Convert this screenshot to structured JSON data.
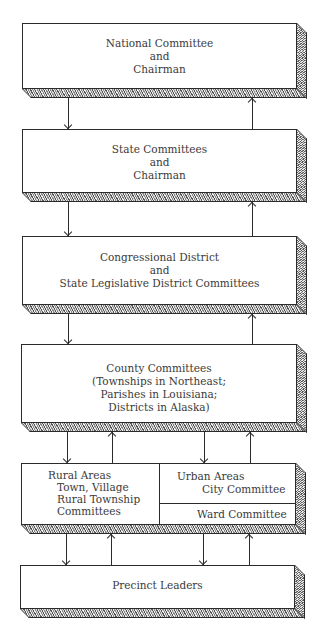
{
  "diagram": {
    "type": "hierarchy",
    "levels": [
      {
        "id": "national",
        "lines": [
          "National Committee",
          "and",
          "Chairman"
        ]
      },
      {
        "id": "state",
        "lines": [
          "State Committees",
          "and",
          "Chairman"
        ]
      },
      {
        "id": "congressional",
        "lines": [
          "Congressional District",
          "and",
          "State Legislative District Committees"
        ]
      },
      {
        "id": "county",
        "lines": [
          "County Committees",
          "(Townships in Northeast;",
          "Parishes in Louisiana;",
          "Districts in Alaska)"
        ]
      },
      {
        "id": "local",
        "rural": {
          "heading": "Rural Areas",
          "lines": [
            "Town, Village",
            "Rural Township",
            "Committees"
          ]
        },
        "urban": {
          "heading": "Urban Areas",
          "lines": [
            "City Committee"
          ]
        },
        "ward": {
          "label": "Ward Committee"
        }
      },
      {
        "id": "precinct",
        "lines": [
          "Precinct Leaders"
        ]
      }
    ],
    "connections": "Each level has a downward arrow (left) and upward arrow (right) to the adjacent level; the local level has paired arrows for rural and urban sections."
  }
}
